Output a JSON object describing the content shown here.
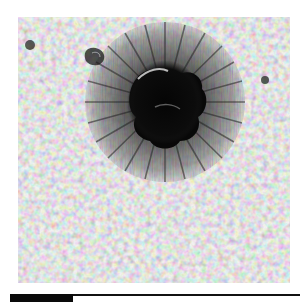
{
  "figure": {
    "colors": {
      "background": "#8a8a8a",
      "umbra": "#0a0a0a",
      "penumbra": "#4a4a4a",
      "granule_light": "#d8d8d8",
      "granule_dark": "#5a5a5a"
    },
    "sunspot": {
      "cx": 147,
      "cy": 85,
      "umbra_rx": 38,
      "umbra_ry": 42,
      "penumbra_r": 80
    },
    "pores": [
      {
        "cx": 12,
        "cy": 28,
        "r": 5
      },
      {
        "cx": 247,
        "cy": 63,
        "r": 4
      },
      {
        "cx": 78,
        "cy": 40,
        "r": 8
      }
    ]
  },
  "scale_bar": {
    "label": ""
  }
}
